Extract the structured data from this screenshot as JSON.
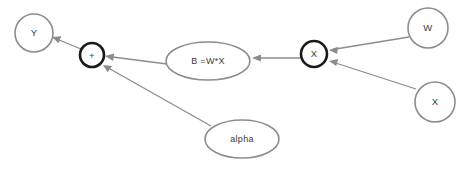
{
  "diagram": {
    "background_color": "#ffffff",
    "stroke_color": "#8c8c8c",
    "bold_stroke_color": "#1a1a1a",
    "text_color": "#3a3a3a",
    "nodes": [
      {
        "id": "y",
        "label": "Y",
        "shape": "circle",
        "emphasis": "normal",
        "cx": 34,
        "cy": 33,
        "rx": 19,
        "ry": 19
      },
      {
        "id": "plus",
        "label": "+",
        "shape": "circle",
        "emphasis": "bold",
        "cx": 92,
        "cy": 55,
        "rx": 12,
        "ry": 12
      },
      {
        "id": "b",
        "label": "B =W*X",
        "shape": "ellipse",
        "emphasis": "normal",
        "cx": 208,
        "cy": 61,
        "rx": 42,
        "ry": 19
      },
      {
        "id": "multiply",
        "label": "X",
        "shape": "circle",
        "emphasis": "bold",
        "cx": 314,
        "cy": 54,
        "rx": 13,
        "ry": 13
      },
      {
        "id": "w",
        "label": "W",
        "shape": "circle",
        "emphasis": "normal",
        "cx": 428,
        "cy": 28,
        "rx": 20,
        "ry": 20
      },
      {
        "id": "x",
        "label": "X",
        "shape": "circle",
        "emphasis": "normal",
        "cx": 435,
        "cy": 102,
        "rx": 20,
        "ry": 20
      },
      {
        "id": "alpha",
        "label": "alpha",
        "shape": "ellipse",
        "emphasis": "normal",
        "cx": 242,
        "cy": 139,
        "rx": 37,
        "ry": 19
      }
    ],
    "edges": [
      {
        "id": "plus-to-y",
        "from": "plus",
        "to": "y",
        "x1": 81,
        "y1": 49,
        "x2": 52,
        "y2": 37
      },
      {
        "id": "b-to-plus",
        "from": "b",
        "to": "plus",
        "x1": 167,
        "y1": 64,
        "x2": 105,
        "y2": 56
      },
      {
        "id": "alpha-to-plus",
        "from": "alpha",
        "to": "plus",
        "x1": 211,
        "y1": 126,
        "x2": 103,
        "y2": 65
      },
      {
        "id": "multiply-to-b",
        "from": "multiply",
        "to": "b",
        "x1": 300,
        "y1": 58,
        "x2": 252,
        "y2": 58
      },
      {
        "id": "w-to-multiply",
        "from": "w",
        "to": "multiply",
        "x1": 409,
        "y1": 37,
        "x2": 329,
        "y2": 50
      },
      {
        "id": "x-to-multiply",
        "from": "x",
        "to": "multiply",
        "x1": 416,
        "y1": 89,
        "x2": 329,
        "y2": 61
      }
    ]
  }
}
